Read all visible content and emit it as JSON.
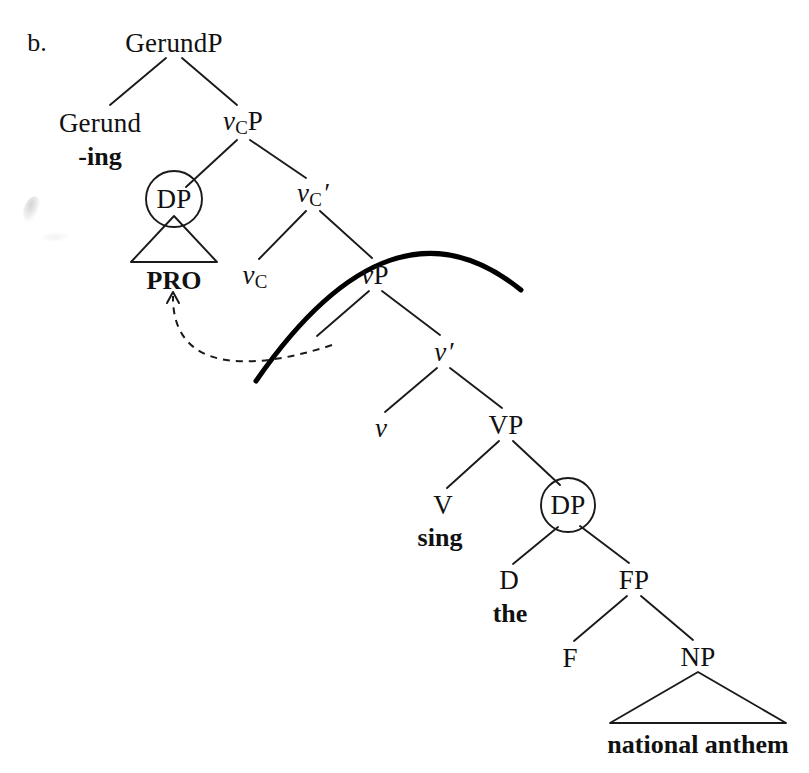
{
  "figure": {
    "item_letter": "b.",
    "type": "syntax-tree"
  },
  "colors": {
    "ink": "#111111",
    "background": "#ffffff",
    "branch": "#1a1a1a",
    "bold_arc": "#000000",
    "dashed_arrow": "#1a1a1a"
  },
  "nodes": [
    {
      "id": "gerundp",
      "label": "GerundP",
      "kind": "phrase",
      "x": 174,
      "y": 43
    },
    {
      "id": "gerund",
      "label": "Gerund",
      "kind": "head",
      "x": 100,
      "y": 123
    },
    {
      "id": "vcp",
      "label": "vCP",
      "kind": "phrase-sub",
      "v": "v",
      "sub": "C",
      "tail": "P",
      "x": 243,
      "y": 123
    },
    {
      "id": "dp1",
      "label": "DP",
      "kind": "circled",
      "x": 174,
      "y": 199
    },
    {
      "id": "vcbar",
      "label": "vC'",
      "kind": "bar-sub",
      "v": "v",
      "sub": "C",
      "tail": "′",
      "x": 313,
      "y": 195
    },
    {
      "id": "vc",
      "label": "vC",
      "kind": "head-sub",
      "v": "v",
      "sub": "C",
      "tail": "",
      "x": 255,
      "y": 277
    },
    {
      "id": "vp",
      "label": "vP",
      "kind": "phrase",
      "v": "v",
      "tail": "P",
      "x": 375,
      "y": 275
    },
    {
      "id": "vbar",
      "label": "v'",
      "kind": "bar",
      "v": "v",
      "tail": "′",
      "x": 444,
      "y": 352
    },
    {
      "id": "littlev",
      "label": "v",
      "kind": "head-v",
      "v": "v",
      "tail": "",
      "x": 381,
      "y": 428
    },
    {
      "id": "vpbig",
      "label": "VP",
      "kind": "phrase",
      "x": 506,
      "y": 425
    },
    {
      "id": "v_head",
      "label": "V",
      "kind": "head",
      "x": 443,
      "y": 505
    },
    {
      "id": "dp2",
      "label": "DP",
      "kind": "circled",
      "x": 568,
      "y": 505
    },
    {
      "id": "d_head",
      "label": "D",
      "kind": "head",
      "x": 509,
      "y": 580
    },
    {
      "id": "fp",
      "label": "FP",
      "kind": "phrase",
      "x": 634,
      "y": 580
    },
    {
      "id": "f_head",
      "label": "F",
      "kind": "head",
      "x": 570,
      "y": 658
    },
    {
      "id": "np",
      "label": "NP",
      "kind": "phrase",
      "x": 698,
      "y": 657
    }
  ],
  "terminals": [
    {
      "id": "ing",
      "text": "-ing",
      "x": 100,
      "y": 157
    },
    {
      "id": "pro",
      "text": "PRO",
      "x": 174,
      "y": 281
    },
    {
      "id": "sing",
      "text": "sing",
      "x": 440,
      "y": 538
    },
    {
      "id": "the",
      "text": "the",
      "x": 510,
      "y": 614
    },
    {
      "id": "anthem",
      "text": "national anthem",
      "x": 698,
      "y": 745
    }
  ],
  "branches": [
    {
      "from": "gerundp",
      "to": "gerund",
      "x1": 166,
      "y1": 58,
      "x2": 110,
      "y2": 105
    },
    {
      "from": "gerundp",
      "to": "vcp",
      "x1": 182,
      "y1": 58,
      "x2": 237,
      "y2": 105
    },
    {
      "from": "vcp",
      "to": "dp1",
      "x1": 237,
      "y1": 140,
      "x2": 186,
      "y2": 187
    },
    {
      "from": "vcp",
      "to": "vcbar",
      "x1": 250,
      "y1": 140,
      "x2": 306,
      "y2": 178
    },
    {
      "from": "vcbar",
      "to": "vc",
      "x1": 306,
      "y1": 211,
      "x2": 259,
      "y2": 259
    },
    {
      "from": "vcbar",
      "to": "vp",
      "x1": 320,
      "y1": 211,
      "x2": 372,
      "y2": 258
    },
    {
      "from": "vp",
      "to": "spec_vp",
      "x1": 369,
      "y1": 291,
      "x2": 317,
      "y2": 336
    },
    {
      "from": "vp",
      "to": "vbar",
      "x1": 382,
      "y1": 291,
      "x2": 440,
      "y2": 335
    },
    {
      "from": "vbar",
      "to": "littlev",
      "x1": 437,
      "y1": 368,
      "x2": 385,
      "y2": 412
    },
    {
      "from": "vbar",
      "to": "vpbig",
      "x1": 450,
      "y1": 368,
      "x2": 502,
      "y2": 408
    },
    {
      "from": "vpbig",
      "to": "v_head",
      "x1": 499,
      "y1": 441,
      "x2": 447,
      "y2": 488
    },
    {
      "from": "vpbig",
      "to": "dp2",
      "x1": 513,
      "y1": 441,
      "x2": 560,
      "y2": 485
    },
    {
      "from": "dp2",
      "to": "d_head",
      "x1": 558,
      "y1": 527,
      "x2": 513,
      "y2": 564
    },
    {
      "from": "dp2",
      "to": "fp",
      "x1": 580,
      "y1": 526,
      "x2": 629,
      "y2": 563
    },
    {
      "from": "fp",
      "to": "f_head",
      "x1": 627,
      "y1": 596,
      "x2": 574,
      "y2": 641
    },
    {
      "from": "fp",
      "to": "np",
      "x1": 641,
      "y1": 596,
      "x2": 693,
      "y2": 640
    }
  ],
  "circles": [
    {
      "node": "dp1",
      "cx": 174,
      "cy": 199,
      "r": 28
    },
    {
      "node": "dp2",
      "cx": 568,
      "cy": 505,
      "r": 27
    }
  ],
  "triangles": [
    {
      "node": "pro-triangle",
      "apex_x": 174,
      "apex_y": 216,
      "left_x": 131,
      "right_x": 217,
      "base_y": 262
    },
    {
      "node": "anthem-triangle",
      "apex_x": 698,
      "apex_y": 672,
      "left_x": 610,
      "right_x": 786,
      "base_y": 723
    }
  ],
  "bold_arc": {
    "name": "bold-movement-arc",
    "start_x": 256,
    "start_y": 381,
    "ctrl_x": 392,
    "ctrl_y": 185,
    "end_x": 521,
    "end_y": 290,
    "stroke_width": 5
  },
  "dashed_arrow": {
    "name": "pro-movement-arrow",
    "start_x": 332,
    "start_y": 345,
    "ctrl1_x": 250,
    "ctrl1_y": 372,
    "ctrl2_x": 172,
    "ctrl2_y": 372,
    "end_x": 173,
    "end_y": 296,
    "arrowhead": "up",
    "stroke_width": 2,
    "dash": "7 6"
  },
  "smudges": [
    {
      "x": 24,
      "y": 196,
      "kind": "primary"
    },
    {
      "x": 40,
      "y": 232,
      "kind": "faint"
    }
  ]
}
